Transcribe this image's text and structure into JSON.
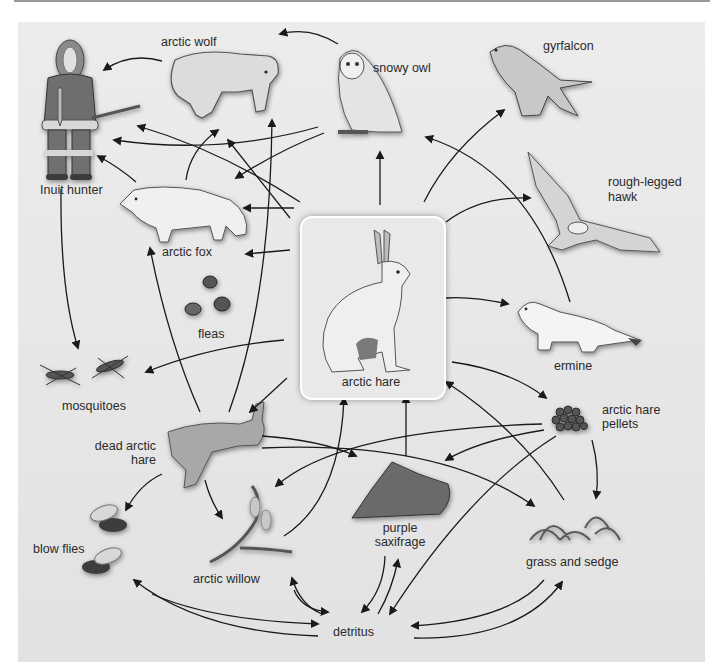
{
  "diagram": {
    "type": "food web",
    "colors": {
      "panel_bg": "#e8e8e8",
      "card_bg": "#e9e9e9",
      "card_border": "#ffffff",
      "arrow": "#1a1a1a",
      "text": "#2a2a2a"
    },
    "center_node": {
      "id": "arctic_hare",
      "label": "arctic hare"
    },
    "nodes": [
      {
        "id": "inuit_hunter",
        "label": "Inuit hunter"
      },
      {
        "id": "arctic_wolf",
        "label": "arctic wolf"
      },
      {
        "id": "snowy_owl",
        "label": "snowy owl"
      },
      {
        "id": "gyrfalcon",
        "label": "gyrfalcon"
      },
      {
        "id": "rough_legged_hawk",
        "label": "rough-legged hawk",
        "label_lines": [
          "rough-legged",
          "hawk"
        ]
      },
      {
        "id": "arctic_fox",
        "label": "arctic fox"
      },
      {
        "id": "fleas",
        "label": "fleas"
      },
      {
        "id": "ermine",
        "label": "ermine"
      },
      {
        "id": "mosquitoes",
        "label": "mosquitoes"
      },
      {
        "id": "arctic_hare",
        "label": "arctic hare"
      },
      {
        "id": "arctic_hare_pellets",
        "label": "arctic hare pellets",
        "label_lines": [
          "arctic hare",
          "pellets"
        ]
      },
      {
        "id": "dead_arctic_hare",
        "label": "dead arctic hare",
        "label_lines": [
          "dead arctic",
          "hare"
        ]
      },
      {
        "id": "blow_flies",
        "label": "blow flies"
      },
      {
        "id": "arctic_willow",
        "label": "arctic willow"
      },
      {
        "id": "purple_saxifrage",
        "label": "purple saxifrage",
        "label_lines": [
          "purple",
          "saxifrage"
        ]
      },
      {
        "id": "grass_and_sedge",
        "label": "grass and sedge"
      },
      {
        "id": "detritus",
        "label": "detritus"
      }
    ],
    "edges": [
      {
        "from": "arctic_wolf",
        "to": "inuit_hunter"
      },
      {
        "from": "snowy_owl",
        "to": "arctic_wolf"
      },
      {
        "from": "arctic_fox",
        "to": "inuit_hunter"
      },
      {
        "from": "arctic_fox",
        "to": "arctic_wolf"
      },
      {
        "from": "snowy_owl",
        "to": "inuit_hunter"
      },
      {
        "from": "snowy_owl",
        "to": "arctic_fox"
      },
      {
        "from": "arctic_hare",
        "to": "inuit_hunter"
      },
      {
        "from": "arctic_hare",
        "to": "arctic_wolf"
      },
      {
        "from": "arctic_hare",
        "to": "snowy_owl"
      },
      {
        "from": "arctic_hare",
        "to": "gyrfalcon"
      },
      {
        "from": "arctic_hare",
        "to": "rough_legged_hawk"
      },
      {
        "from": "arctic_hare",
        "to": "arctic_fox"
      },
      {
        "from": "arctic_hare",
        "to": "fleas"
      },
      {
        "from": "arctic_hare",
        "to": "ermine"
      },
      {
        "from": "arctic_hare",
        "to": "mosquitoes"
      },
      {
        "from": "arctic_hare",
        "to": "dead_arctic_hare"
      },
      {
        "from": "arctic_hare",
        "to": "arctic_hare_pellets"
      },
      {
        "from": "ermine",
        "to": "snowy_owl"
      },
      {
        "from": "inuit_hunter",
        "to": "mosquitoes"
      },
      {
        "from": "dead_arctic_hare",
        "to": "arctic_fox"
      },
      {
        "from": "dead_arctic_hare",
        "to": "arctic_wolf"
      },
      {
        "from": "dead_arctic_hare",
        "to": "blow_flies"
      },
      {
        "from": "dead_arctic_hare",
        "to": "arctic_willow"
      },
      {
        "from": "dead_arctic_hare",
        "to": "purple_saxifrage"
      },
      {
        "from": "dead_arctic_hare",
        "to": "grass_and_sedge"
      },
      {
        "from": "arctic_hare_pellets",
        "to": "arctic_willow"
      },
      {
        "from": "arctic_hare_pellets",
        "to": "purple_saxifrage"
      },
      {
        "from": "arctic_hare_pellets",
        "to": "grass_and_sedge"
      },
      {
        "from": "arctic_hare_pellets",
        "to": "detritus"
      },
      {
        "from": "arctic_willow",
        "to": "arctic_hare"
      },
      {
        "from": "purple_saxifrage",
        "to": "arctic_hare"
      },
      {
        "from": "grass_and_sedge",
        "to": "arctic_hare"
      },
      {
        "from": "blow_flies",
        "to": "detritus"
      },
      {
        "from": "detritus",
        "to": "blow_flies"
      },
      {
        "from": "arctic_willow",
        "to": "detritus"
      },
      {
        "from": "detritus",
        "to": "arctic_willow"
      },
      {
        "from": "purple_saxifrage",
        "to": "detritus"
      },
      {
        "from": "detritus",
        "to": "purple_saxifrage"
      },
      {
        "from": "grass_and_sedge",
        "to": "detritus"
      },
      {
        "from": "detritus",
        "to": "grass_and_sedge"
      }
    ]
  },
  "labels": {
    "arctic_wolf": "arctic wolf",
    "snowy_owl": "snowy owl",
    "gyrfalcon": "gyrfalcon",
    "inuit_hunter": "Inuit hunter",
    "rough_legged_1": "rough-legged",
    "rough_legged_2": "hawk",
    "arctic_fox": "arctic fox",
    "fleas": "fleas",
    "arctic_hare": "arctic hare",
    "ermine": "ermine",
    "mosquitoes": "mosquitoes",
    "pellets_1": "arctic hare",
    "pellets_2": "pellets",
    "dead_hare_1": "dead arctic",
    "dead_hare_2": "hare",
    "blow_flies": "blow flies",
    "arctic_willow": "arctic willow",
    "saxifrage_1": "purple",
    "saxifrage_2": "saxifrage",
    "grass_and_sedge": "grass and sedge",
    "detritus": "detritus"
  }
}
